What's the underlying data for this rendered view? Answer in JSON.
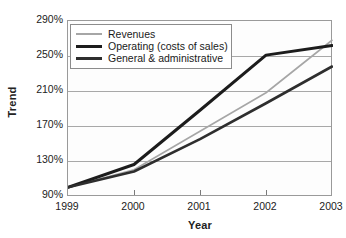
{
  "chart_data": {
    "type": "line",
    "title": "",
    "xlabel": "Year",
    "ylabel": "Trend",
    "categories": [
      "1999",
      "2000",
      "2001",
      "2002",
      "2003"
    ],
    "x": [
      1999,
      2000,
      2001,
      2002,
      2003
    ],
    "xlim": [
      1999,
      2003
    ],
    "ylim": [
      90,
      290
    ],
    "yticks": [
      "90%",
      "130%",
      "170%",
      "210%",
      "250%",
      "290%"
    ],
    "ytick_values": [
      90,
      130,
      170,
      210,
      250,
      290
    ],
    "ytick_step": 40,
    "grid": "horizontal",
    "legend_position": "top-left-inside",
    "series": [
      {
        "name": "Revenues",
        "values": [
          100,
          120,
          164,
          208,
          268
        ],
        "color": "#a6a6a6",
        "width": 1.6
      },
      {
        "name": "Operating (costs of sales)",
        "values": [
          100,
          126,
          188,
          251,
          262
        ],
        "color": "#1c1c1c",
        "width": 3.0
      },
      {
        "name": "General & administrative",
        "values": [
          100,
          118,
          155,
          196,
          238
        ],
        "color": "#2e2e2e",
        "width": 2.6
      }
    ]
  },
  "legend": {
    "items": [
      {
        "label": "Revenues"
      },
      {
        "label": "Operating (costs of sales)"
      },
      {
        "label": "General & administrative"
      }
    ]
  },
  "axes": {
    "y_title": "Trend",
    "x_title": "Year"
  }
}
